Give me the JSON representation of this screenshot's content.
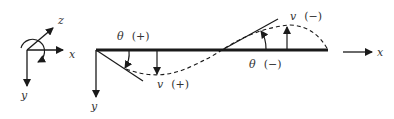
{
  "diagram": {
    "title": "",
    "colors": {
      "ink": "#1a1a1a",
      "label": "#333333",
      "background": "#ffffff"
    },
    "triad": {
      "x_label": "x",
      "y_label": "y",
      "z_label": "z"
    },
    "beam": {
      "x_label": "x",
      "y_label": "y"
    },
    "annotations": {
      "theta_pos_symbol": "θ",
      "theta_pos_sign": "(+)",
      "v_pos_symbol": "v",
      "v_pos_sign": "(+)",
      "theta_neg_symbol": "θ",
      "theta_neg_sign": "(−)",
      "v_neg_symbol": "v",
      "v_neg_sign": "(−)"
    }
  }
}
